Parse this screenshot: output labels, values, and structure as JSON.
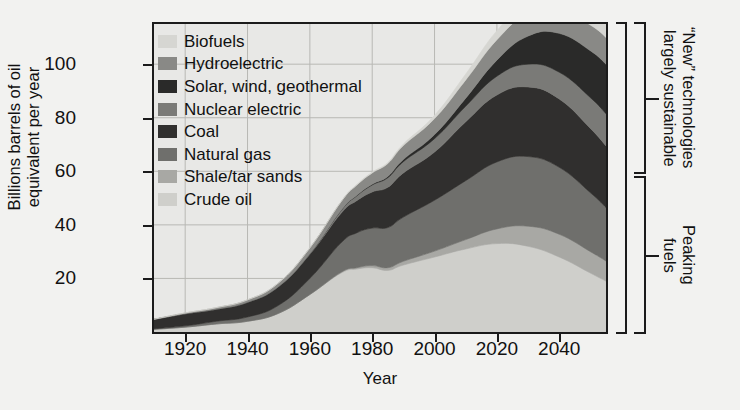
{
  "chart_data": {
    "type": "area",
    "title": "",
    "xlabel": "Year",
    "ylabel": "Billions barrels of oil\nequivalent per year",
    "xlim": [
      1910,
      2055
    ],
    "ylim": [
      0,
      115
    ],
    "xticks": [
      1920,
      1940,
      1960,
      1980,
      2000,
      2020,
      2040
    ],
    "yticks": [
      20,
      40,
      60,
      80,
      100
    ],
    "grid": true,
    "stacked": true,
    "legend_position": "upper-left-inside",
    "x": [
      1910,
      1920,
      1930,
      1940,
      1950,
      1960,
      1970,
      1975,
      1980,
      1985,
      1990,
      2000,
      2010,
      2020,
      2030,
      2040,
      2050,
      2055
    ],
    "series": [
      {
        "name": "Crude oil",
        "color": "#cfcfcb",
        "values": [
          1.0,
          1.8,
          3.0,
          4.0,
          7.0,
          14.0,
          22.0,
          23.5,
          24.0,
          23.0,
          25.0,
          28.0,
          31.0,
          33.0,
          32.0,
          28.0,
          22.0,
          19.0
        ]
      },
      {
        "name": "Shale/tar sands",
        "color": "#a8a8a4",
        "values": [
          0.0,
          0.0,
          0.0,
          0.0,
          0.0,
          0.0,
          0.3,
          0.5,
          0.8,
          1.0,
          1.4,
          2.2,
          3.5,
          5.5,
          7.5,
          8.5,
          8.0,
          7.5
        ]
      },
      {
        "name": "Natural gas",
        "color": "#6f6f6c",
        "values": [
          0.2,
          0.5,
          1.0,
          1.6,
          3.0,
          6.0,
          11.0,
          13.0,
          14.0,
          15.0,
          16.5,
          19.0,
          22.0,
          25.0,
          26.0,
          25.0,
          22.0,
          20.0
        ]
      },
      {
        "name": "Coal",
        "color": "#302f2e",
        "values": [
          3.5,
          4.5,
          4.5,
          5.5,
          7.0,
          9.0,
          11.0,
          12.0,
          13.5,
          15.0,
          16.5,
          18.0,
          22.0,
          25.0,
          26.0,
          25.5,
          24.0,
          23.0
        ]
      },
      {
        "name": "Nuclear electric",
        "color": "#7a7a77",
        "values": [
          0.0,
          0.0,
          0.0,
          0.0,
          0.0,
          0.2,
          1.0,
          1.8,
          2.6,
          3.6,
          4.2,
          5.0,
          5.8,
          7.0,
          8.5,
          10.0,
          11.5,
          12.0
        ]
      },
      {
        "name": "Solar, wind, geothermal",
        "color": "#2a2a29",
        "values": [
          0.0,
          0.0,
          0.0,
          0.0,
          0.0,
          0.0,
          0.1,
          0.2,
          0.3,
          0.5,
          0.8,
          1.5,
          3.0,
          6.0,
          10.5,
          14.5,
          17.5,
          18.5
        ]
      },
      {
        "name": "Hydroelectric",
        "color": "#898986",
        "values": [
          0.1,
          0.3,
          0.6,
          0.9,
          1.4,
          2.2,
          3.2,
          3.8,
          4.2,
          4.8,
          5.2,
          6.0,
          6.8,
          7.6,
          8.4,
          9.0,
          9.6,
          10.0
        ]
      },
      {
        "name": "Biofuels",
        "color": "#d6d6d2",
        "values": [
          0.0,
          0.0,
          0.0,
          0.0,
          0.0,
          0.0,
          0.1,
          0.2,
          0.3,
          0.4,
          0.6,
          1.2,
          2.2,
          3.4,
          4.6,
          5.6,
          6.4,
          7.0
        ]
      }
    ],
    "annotations": [
      {
        "name": "new-technologies",
        "text": "“New” technologies\nlargely sustainable"
      },
      {
        "name": "peaking-fuels",
        "text": "Peaking\nfuels"
      }
    ]
  },
  "axes": {
    "y": {
      "title": "Billions barrels of oil\nequivalent per year",
      "ticks": [
        {
          "value": 100,
          "label": "100"
        },
        {
          "value": 80,
          "label": "80"
        },
        {
          "value": 60,
          "label": "60"
        },
        {
          "value": 40,
          "label": "40"
        },
        {
          "value": 20,
          "label": "20"
        }
      ]
    },
    "x": {
      "title": "Year",
      "ticks": [
        {
          "value": 1920,
          "label": "1920"
        },
        {
          "value": 1940,
          "label": "1940"
        },
        {
          "value": 1960,
          "label": "1960"
        },
        {
          "value": 1980,
          "label": "1980"
        },
        {
          "value": 2000,
          "label": "2000"
        },
        {
          "value": 2020,
          "label": "2020"
        },
        {
          "value": 2040,
          "label": "2040"
        }
      ]
    }
  },
  "legend": {
    "items": [
      {
        "label": "Biofuels",
        "color": "#d6d6d2"
      },
      {
        "label": "Hydroelectric",
        "color": "#898986"
      },
      {
        "label": "Solar, wind, geothermal",
        "color": "#2a2a29"
      },
      {
        "label": "Nuclear electric",
        "color": "#7a7a77"
      },
      {
        "label": "Coal",
        "color": "#302f2e"
      },
      {
        "label": "Natural gas",
        "color": "#6f6f6c"
      },
      {
        "label": "Shale/tar sands",
        "color": "#a8a8a4"
      },
      {
        "label": "Crude oil",
        "color": "#cfcfcb"
      }
    ]
  },
  "brackets": [
    {
      "name": "new-technologies-bracket",
      "text": "“New” technologies\nlargely sustainable",
      "top": 22,
      "height": 152
    },
    {
      "name": "peaking-fuels-bracket",
      "text": "Peaking\nfuels",
      "top": 176,
      "height": 158
    }
  ],
  "colors": {
    "frame": "#1b1b1b",
    "plot_background": "#e8e8e6",
    "page_background": "#f2f2f0",
    "grid": "#b8b8b4"
  }
}
